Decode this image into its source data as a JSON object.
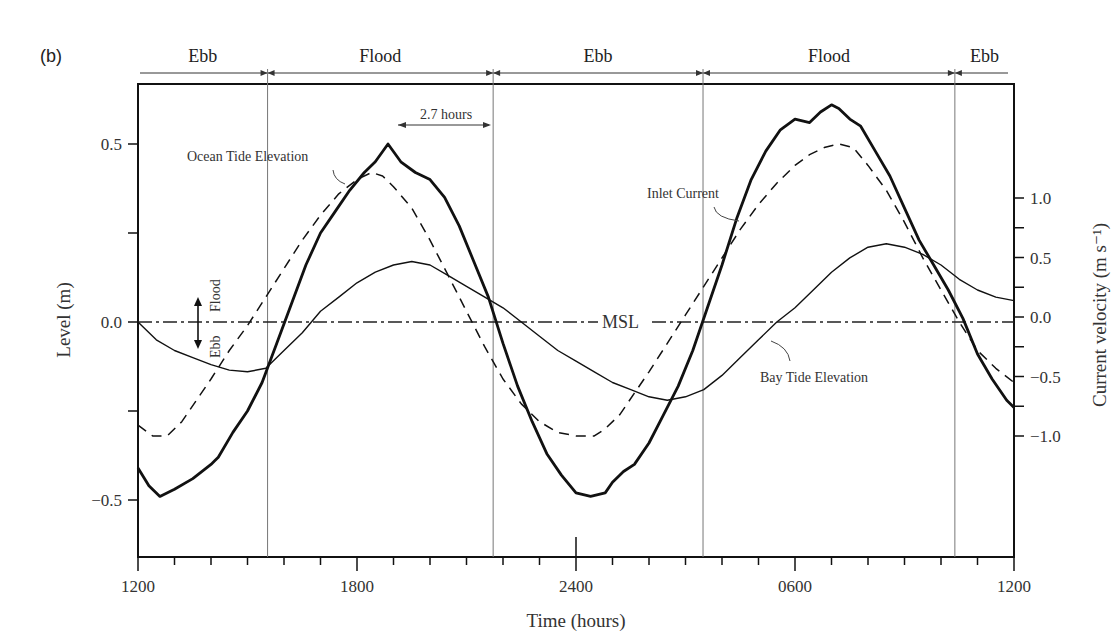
{
  "panel_label": "(b)",
  "phases": [
    {
      "label": "Ebb",
      "start_h": 0.0,
      "end_h": 3.55
    },
    {
      "label": "Flood",
      "start_h": 3.55,
      "end_h": 9.73
    },
    {
      "label": "Ebb",
      "start_h": 9.73,
      "end_h": 15.48
    },
    {
      "label": "Flood",
      "start_h": 15.48,
      "end_h": 22.38
    },
    {
      "label": "Ebb",
      "start_h": 22.38,
      "end_h": 24.0
    }
  ],
  "annotations": {
    "ocean_label": "Ocean Tide Elevation",
    "inlet_label": "Inlet Current",
    "bay_label": "Bay Tide Elevation",
    "msl_label": "MSL",
    "lag_label": "2.7 hours",
    "flood_arrow_label": "Flood",
    "ebb_arrow_label": "Ebb"
  },
  "chart_data": {
    "type": "line",
    "title": "",
    "xlabel": "Time (hours)",
    "ylabel": "Level (m)",
    "y2label": "Current velocity (m s⁻¹)",
    "x_tick_labels": [
      "1200",
      "1800",
      "2400",
      "0600",
      "1200"
    ],
    "x_tick_hours": [
      0,
      6,
      12,
      18,
      24
    ],
    "x_minor_step_h": 1,
    "xlim_hours": [
      0,
      24
    ],
    "ylim": [
      -0.66,
      0.67
    ],
    "y_ticks": [
      -0.5,
      0.0,
      0.5
    ],
    "y_tick_labels": [
      "−0.5",
      "0.0",
      "0.5"
    ],
    "y_minor_ticks": [
      -0.25,
      0.25
    ],
    "y2lim": [
      -1.3,
      1.6
    ],
    "y2_ticks": [
      -1.0,
      -0.5,
      0.0,
      0.5,
      1.0
    ],
    "y2_tick_labels": [
      "−1.0",
      "−0.5",
      "0.0",
      "0.5",
      "1.0"
    ],
    "y2_minor_ticks": [
      -0.75,
      -0.25,
      0.25,
      0.75
    ],
    "phase_boundaries_hours": [
      3.55,
      9.73,
      15.48,
      22.38
    ],
    "grid": false,
    "series": [
      {
        "name": "Ocean Tide Elevation",
        "style": "solid-thick",
        "axis": "left",
        "x_hours": [
          0,
          0.3,
          0.6,
          1.0,
          1.5,
          2.0,
          2.1,
          2.2,
          2.6,
          3.0,
          3.4,
          3.8,
          4.2,
          4.6,
          5.0,
          5.4,
          5.8,
          6.2,
          6.5,
          6.85,
          7.2,
          7.6,
          8.0,
          8.4,
          8.8,
          9.2,
          9.6,
          10.0,
          10.4,
          10.8,
          11.2,
          11.6,
          12.0,
          12.4,
          12.8,
          13.0,
          13.3,
          13.6,
          14.0,
          14.4,
          14.8,
          15.2,
          15.6,
          16.0,
          16.4,
          16.8,
          17.2,
          17.6,
          18.0,
          18.4,
          18.7,
          19.0,
          19.2,
          19.5,
          19.8,
          20.2,
          20.6,
          21.0,
          21.4,
          21.8,
          22.2,
          22.6,
          23.0,
          23.4,
          23.8,
          24.0
        ],
        "values": [
          -0.41,
          -0.46,
          -0.49,
          -0.47,
          -0.44,
          -0.4,
          -0.39,
          -0.38,
          -0.31,
          -0.25,
          -0.17,
          -0.06,
          0.05,
          0.16,
          0.25,
          0.31,
          0.37,
          0.42,
          0.45,
          0.5,
          0.45,
          0.42,
          0.4,
          0.35,
          0.27,
          0.17,
          0.07,
          -0.06,
          -0.18,
          -0.28,
          -0.37,
          -0.43,
          -0.48,
          -0.49,
          -0.48,
          -0.45,
          -0.42,
          -0.4,
          -0.34,
          -0.26,
          -0.18,
          -0.08,
          0.04,
          0.16,
          0.29,
          0.4,
          0.48,
          0.54,
          0.57,
          0.56,
          0.59,
          0.61,
          0.6,
          0.57,
          0.55,
          0.48,
          0.41,
          0.32,
          0.23,
          0.16,
          0.09,
          0.01,
          -0.09,
          -0.16,
          -0.22,
          -0.24
        ]
      },
      {
        "name": "Inlet Current",
        "style": "dashed",
        "axis": "left",
        "x_hours": [
          0,
          0.4,
          0.8,
          1.2,
          1.6,
          2.0,
          2.5,
          3.0,
          3.5,
          4.0,
          4.5,
          5.0,
          5.5,
          6.0,
          6.4,
          6.7,
          7.0,
          7.5,
          8.0,
          8.5,
          9.0,
          9.5,
          10.0,
          10.5,
          11.0,
          11.5,
          12.0,
          12.5,
          12.8,
          13.2,
          13.6,
          14.0,
          14.5,
          15.0,
          15.5,
          16.0,
          16.5,
          17.0,
          17.5,
          18.0,
          18.4,
          18.8,
          19.2,
          19.6,
          20.0,
          20.5,
          21.0,
          21.5,
          22.0,
          22.5,
          23.0,
          23.5,
          24.0
        ],
        "values": [
          -0.29,
          -0.32,
          -0.32,
          -0.28,
          -0.22,
          -0.16,
          -0.08,
          -0.01,
          0.07,
          0.15,
          0.23,
          0.3,
          0.36,
          0.4,
          0.42,
          0.41,
          0.38,
          0.32,
          0.23,
          0.13,
          0.03,
          -0.07,
          -0.16,
          -0.23,
          -0.28,
          -0.31,
          -0.32,
          -0.32,
          -0.3,
          -0.26,
          -0.2,
          -0.14,
          -0.06,
          0.02,
          0.1,
          0.18,
          0.26,
          0.33,
          0.39,
          0.44,
          0.47,
          0.49,
          0.5,
          0.49,
          0.44,
          0.37,
          0.28,
          0.18,
          0.09,
          0.0,
          -0.08,
          -0.13,
          -0.17
        ]
      },
      {
        "name": "Bay Tide Elevation",
        "style": "solid-thin",
        "axis": "left",
        "x_hours": [
          0,
          0.5,
          1.0,
          1.5,
          2.0,
          2.5,
          3.0,
          3.5,
          4.0,
          4.5,
          5.0,
          5.5,
          6.0,
          6.5,
          7.0,
          7.5,
          8.0,
          8.5,
          9.0,
          9.5,
          10.0,
          10.5,
          11.0,
          11.5,
          12.0,
          12.5,
          13.0,
          13.5,
          14.0,
          14.5,
          15.0,
          15.5,
          16.0,
          16.5,
          17.0,
          17.5,
          18.0,
          18.5,
          19.0,
          19.5,
          20.0,
          20.5,
          21.0,
          21.5,
          22.0,
          22.5,
          23.0,
          23.5,
          24.0
        ],
        "values": [
          0.0,
          -0.05,
          -0.08,
          -0.1,
          -0.12,
          -0.135,
          -0.14,
          -0.13,
          -0.08,
          -0.03,
          0.03,
          0.07,
          0.11,
          0.14,
          0.16,
          0.17,
          0.16,
          0.13,
          0.1,
          0.07,
          0.04,
          0.0,
          -0.04,
          -0.08,
          -0.11,
          -0.14,
          -0.17,
          -0.19,
          -0.21,
          -0.22,
          -0.21,
          -0.19,
          -0.15,
          -0.1,
          -0.05,
          0.0,
          0.04,
          0.09,
          0.14,
          0.18,
          0.21,
          0.22,
          0.21,
          0.19,
          0.16,
          0.12,
          0.09,
          0.07,
          0.06
        ]
      }
    ],
    "msl_level": 0.0,
    "legend_position": "inline labels"
  }
}
